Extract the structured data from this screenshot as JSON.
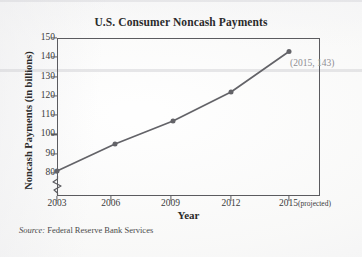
{
  "page": {
    "top_cropped_text": "",
    "source_label": "Source:",
    "source_text": "Federal Reserve Bank Services"
  },
  "chart_data": {
    "type": "line",
    "title": "U.S. Consumer Noncash Payments",
    "xlabel": "Year",
    "ylabel": "Noncash Payments (in billions)",
    "categories": [
      "2003",
      "2006",
      "2009",
      "2012",
      "2015"
    ],
    "x_tick_labels": [
      "2003",
      "2006",
      "2009",
      "2012",
      "2015"
    ],
    "x_last_tick_suffix": "(projected)",
    "values": [
      81,
      95,
      107,
      122,
      143
    ],
    "y_tick_labels": [
      "150",
      "140",
      "130",
      "120",
      "110",
      "100",
      "90",
      "80"
    ],
    "y_ticks": [
      150,
      140,
      130,
      120,
      110,
      100,
      90,
      80
    ],
    "ylim": [
      80,
      150
    ],
    "xlim": [
      2003,
      2015
    ],
    "y_axis_break": true,
    "grid": false,
    "legend": false,
    "series_color": "#636368",
    "marker": "circle",
    "annotations": [
      {
        "text": "(2015, 143)",
        "x": 2015,
        "y": 143,
        "color": "#8e8e93"
      }
    ]
  }
}
